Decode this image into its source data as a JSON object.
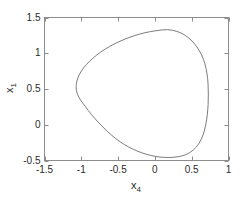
{
  "chart_data": {
    "type": "line",
    "title": "",
    "subtitle": "",
    "xlabel": "x_4",
    "xlabel_base": "x",
    "xlabel_sub": "4",
    "ylabel": "x_1",
    "ylabel_base": "x",
    "ylabel_sub": "1",
    "xlim": [
      -1.5,
      1.0
    ],
    "ylim": [
      -0.5,
      1.5
    ],
    "xticks": [
      -1.5,
      -1,
      -0.5,
      0,
      0.5,
      1
    ],
    "xtick_labels": [
      "-1.5",
      "-1",
      "-0.5",
      "0",
      "0.5",
      "1"
    ],
    "yticks": [
      -0.5,
      0,
      0.5,
      1,
      1.5
    ],
    "ytick_labels": [
      "-0.5",
      "0",
      "0.5",
      "1",
      "1.5"
    ],
    "grid": false,
    "legend": null,
    "box": true,
    "tick_direction": "in",
    "line_color": "#5a5a5a",
    "line_width": 0.8,
    "axis_color": "#8c8c8c",
    "text_color": "#2b2b2b",
    "background": "#ffffff",
    "series": [
      {
        "name": "closed orbit",
        "closed": true,
        "points": [
          [
            0.17,
            1.33
          ],
          [
            0.3,
            1.305
          ],
          [
            0.4,
            1.258
          ],
          [
            0.49,
            1.185
          ],
          [
            0.57,
            1.09
          ],
          [
            0.635,
            0.975
          ],
          [
            0.68,
            0.85
          ],
          [
            0.708,
            0.715
          ],
          [
            0.722,
            0.575
          ],
          [
            0.726,
            0.43
          ],
          [
            0.723,
            0.285
          ],
          [
            0.712,
            0.14
          ],
          [
            0.69,
            -0.005
          ],
          [
            0.655,
            -0.14
          ],
          [
            0.6,
            -0.26
          ],
          [
            0.52,
            -0.355
          ],
          [
            0.42,
            -0.418
          ],
          [
            0.31,
            -0.448
          ],
          [
            0.19,
            -0.458
          ],
          [
            0.07,
            -0.452
          ],
          [
            -0.05,
            -0.43
          ],
          [
            -0.17,
            -0.395
          ],
          [
            -0.29,
            -0.345
          ],
          [
            -0.41,
            -0.28
          ],
          [
            -0.53,
            -0.195
          ],
          [
            -0.65,
            -0.09
          ],
          [
            -0.76,
            0.025
          ],
          [
            -0.86,
            0.14
          ],
          [
            -0.945,
            0.255
          ],
          [
            -1.01,
            0.345
          ],
          [
            -1.055,
            0.435
          ],
          [
            -1.07,
            0.52
          ],
          [
            -1.06,
            0.61
          ],
          [
            -1.025,
            0.705
          ],
          [
            -0.965,
            0.8
          ],
          [
            -0.885,
            0.89
          ],
          [
            -0.79,
            0.975
          ],
          [
            -0.68,
            1.055
          ],
          [
            -0.555,
            1.128
          ],
          [
            -0.42,
            1.192
          ],
          [
            -0.28,
            1.245
          ],
          [
            -0.135,
            1.287
          ],
          [
            0.015,
            1.315
          ],
          [
            0.17,
            1.33
          ]
        ]
      }
    ]
  }
}
